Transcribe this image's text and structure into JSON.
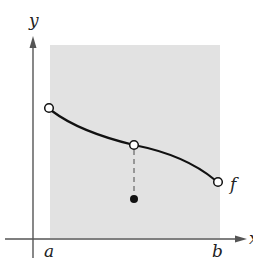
{
  "figure": {
    "axis_labels": {
      "y": "y",
      "x": "x"
    },
    "point_labels": {
      "a": "a",
      "b": "b"
    },
    "function_label": "f",
    "colors": {
      "shade": "#e2e2e2",
      "axis": "#555555",
      "curve": "#111111",
      "dashed": "#777777"
    },
    "elements": {
      "shaded_interval": "[a, b]",
      "left_endpoint": "open circle at x=a",
      "right_endpoint": "open circle at x=b",
      "interior_hole": "open circle on curve at midpoint",
      "isolated_value": "filled dot below the hole"
    }
  }
}
